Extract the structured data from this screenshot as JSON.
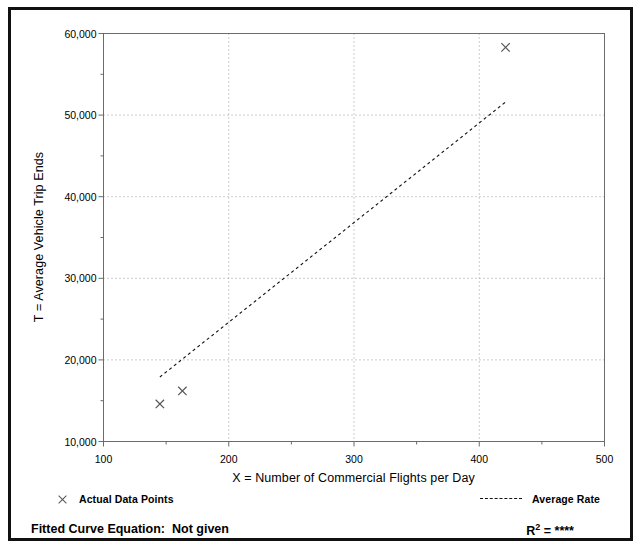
{
  "chart_data": {
    "type": "scatter",
    "title": "",
    "xlabel": "X = Number of Commercial Flights per Day",
    "ylabel": "T = Average Vehicle Trip Ends",
    "xlim": [
      100,
      500
    ],
    "ylim": [
      10000,
      60000
    ],
    "x_ticks": [
      100,
      200,
      300,
      400,
      500
    ],
    "x_tick_labels": [
      "100",
      "200",
      "300",
      "400",
      "500"
    ],
    "x_minor_ticks": [
      150,
      250,
      350,
      450
    ],
    "y_ticks": [
      10000,
      20000,
      30000,
      40000,
      50000,
      60000
    ],
    "y_tick_labels": [
      "10,000",
      "20,000",
      "30,000",
      "40,000",
      "50,000",
      "60,000"
    ],
    "y_minor_ticks": [
      15000,
      25000,
      35000,
      45000,
      55000
    ],
    "grid": true,
    "grid_style": "dotted",
    "legend_position": "below-plot",
    "series": [
      {
        "name": "Actual Data Points",
        "type": "scatter",
        "marker": "x",
        "color": "#555555",
        "points": [
          {
            "x": 145,
            "y": 14600
          },
          {
            "x": 163,
            "y": 16200
          },
          {
            "x": 421,
            "y": 58300
          }
        ]
      },
      {
        "name": "Average Rate",
        "type": "line",
        "style": "dashed",
        "color": "#111111",
        "points": [
          {
            "x": 145,
            "y": 17900
          },
          {
            "x": 421,
            "y": 51600
          }
        ]
      }
    ]
  },
  "legend": {
    "data_points_label": "Actual Data Points",
    "average_rate_label": "Average Rate",
    "data_points_marker": "x-marker-icon",
    "average_rate_marker": "dashed-line-icon"
  },
  "footer": {
    "equation_label": "Fitted Curve Equation:  Not given",
    "r2_prefix": "R",
    "r2_superscript": "2",
    "r2_value": " = ****"
  },
  "colors": {
    "border": "#111111",
    "axis": "#6b6b6b",
    "grid": "#9a9a9a",
    "marker": "#555555",
    "trend": "#111111",
    "text": "#000000"
  }
}
